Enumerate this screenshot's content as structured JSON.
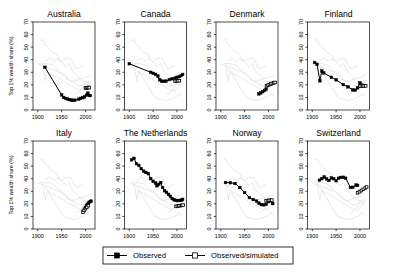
{
  "figure": {
    "width": 394,
    "height": 274,
    "background": "#ffffff",
    "foreground_color": "#000000",
    "background_series_color": "#d7d7d7"
  },
  "axes": {
    "ylabel": "Top 1% wealth share (%)",
    "ylim": [
      0,
      70
    ],
    "yticks": [
      0,
      10,
      20,
      30,
      40,
      50,
      60,
      70
    ],
    "xlim": [
      1890,
      2020
    ],
    "xticks": [
      1900,
      1950,
      2000
    ],
    "xticklabels": [
      "1900",
      "1950",
      "2000"
    ],
    "xlabel": ""
  },
  "legend": {
    "position": "bottom-center",
    "entries": [
      {
        "label": "Observed",
        "marker": "filled-square",
        "line": true
      },
      {
        "label": "Observed/simulated",
        "marker": "open-square",
        "line": true
      }
    ]
  },
  "chart_data": {
    "type": "line",
    "title": "",
    "xlabel": "",
    "ylabel": "Top 1% wealth share (%)",
    "xlim": [
      1890,
      2020
    ],
    "ylim": [
      0,
      70
    ],
    "xticks": [
      1900,
      1950,
      2000
    ],
    "yticks": [
      0,
      10,
      20,
      30,
      40,
      50,
      60,
      70
    ],
    "grid": false,
    "legend_position": "bottom-center",
    "layout": {
      "rows": 2,
      "cols": 4
    },
    "panels": [
      {
        "title": "Australia",
        "row": 0,
        "col": 0,
        "series": [
          {
            "name": "Observed",
            "marker": "filled-square",
            "x": [
              1915,
              1950,
              1954,
              1958,
              1962,
              1966,
              1970,
              1974,
              1978,
              1986,
              1990,
              1994,
              1998,
              2002,
              2005,
              2008,
              2010
            ],
            "y": [
              34.0,
              12.0,
              10.0,
              9.3,
              8.8,
              8.3,
              8.0,
              7.6,
              7.8,
              8.6,
              9.3,
              9.8,
              10.4,
              11.8,
              13.4,
              11.6,
              11.5
            ]
          },
          {
            "name": "Observed/simulated",
            "marker": "open-square",
            "x": [
              2000,
              2002,
              2004,
              2006,
              2008
            ],
            "y": [
              17.6,
              17.6,
              17.8,
              17.9,
              17.8
            ]
          }
        ]
      },
      {
        "title": "Canada",
        "row": 0,
        "col": 1,
        "series": [
          {
            "name": "Observed",
            "marker": "filled-square",
            "x": [
              1900,
              1945,
              1950,
              1955,
              1960,
              1964,
              1968,
              1972,
              1977,
              1984,
              1990,
              1996,
              2000,
              2005,
              2009,
              2012
            ],
            "y": [
              36.8,
              30.0,
              29.2,
              28.4,
              27.0,
              24.0,
              23.0,
              22.8,
              23.0,
              24.2,
              24.8,
              25.3,
              26.0,
              26.5,
              27.4,
              28.3
            ]
          },
          {
            "name": "Observed/simulated",
            "marker": "open-square",
            "x": [
              1996,
              1999,
              2002,
              2005
            ],
            "y": [
              23.0,
              23.1,
              23.2,
              23.3
            ]
          }
        ]
      },
      {
        "title": "Denmark",
        "row": 0,
        "col": 2,
        "series": [
          {
            "name": "Observed",
            "marker": "filled-square",
            "x": [
              1980,
              1984,
              1988,
              1992,
              1995
            ],
            "y": [
              12.8,
              13.6,
              14.6,
              15.6,
              16.6
            ]
          },
          {
            "name": "Observed/simulated",
            "marker": "open-square",
            "x": [
              1996,
              1999,
              2002,
              2005,
              2008,
              2011,
              2014
            ],
            "y": [
              19.2,
              19.8,
              20.3,
              20.7,
              21.2,
              21.6,
              21.9
            ]
          }
        ]
      },
      {
        "title": "Finland",
        "row": 0,
        "col": 3,
        "series": [
          {
            "name": "Observed",
            "marker": "filled-square",
            "x": [
              1905,
              1910,
              1916,
              1920,
              1924,
              1940,
              1950,
              1965,
              1975,
              1985,
              1990,
              1995,
              2000,
              2004,
              2009
            ],
            "y": [
              37.8,
              36.4,
              23.2,
              31.0,
              29.5,
              26.0,
              24.0,
              20.2,
              18.4,
              16.0,
              15.8,
              17.6,
              21.5,
              19.8,
              19.4
            ]
          },
          {
            "name": "Observed/simulated",
            "marker": "open-square",
            "x": [
              2000,
              2003,
              2006,
              2009,
              2012
            ],
            "y": [
              19.0,
              19.1,
              19.1,
              19.2,
              19.2
            ]
          }
        ]
      },
      {
        "title": "Italy",
        "row": 1,
        "col": 0,
        "series": [
          {
            "name": "Observed",
            "marker": "filled-square",
            "x": [
              1995,
              1998,
              2000,
              2002,
              2004,
              2006,
              2008,
              2010,
              2012
            ],
            "y": [
              14.0,
              15.8,
              17.2,
              18.4,
              19.2,
              20.4,
              21.2,
              21.8,
              22.2
            ]
          },
          {
            "name": "Observed/simulated",
            "marker": "open-square",
            "x": [
              1995,
              1997,
              2000,
              2003,
              2006
            ],
            "y": [
              13.4,
              14.8,
              16.2,
              17.4,
              18.6
            ]
          }
        ]
      },
      {
        "title": "The Netherlands",
        "row": 1,
        "col": 1,
        "series": [
          {
            "name": "Observed",
            "marker": "filled-square",
            "x": [
              1905,
              1910,
              1915,
              1920,
              1925,
              1930,
              1935,
              1940,
              1945,
              1950,
              1955,
              1958,
              1962,
              1966,
              1970,
              1974,
              1978,
              1982,
              1986,
              1990,
              1994,
              1998,
              2002,
              2006,
              2010,
              2012
            ],
            "y": [
              55.0,
              56.2,
              52.0,
              50.6,
              48.0,
              46.0,
              45.0,
              44.0,
              40.0,
              38.0,
              36.6,
              34.4,
              35.6,
              37.0,
              33.0,
              30.4,
              29.2,
              27.6,
              26.0,
              24.2,
              23.2,
              22.8,
              22.6,
              22.8,
              23.0,
              23.6
            ]
          },
          {
            "name": "Observed/simulated",
            "marker": "open-square",
            "x": [
              1998,
              2001,
              2004,
              2007,
              2010,
              2013
            ],
            "y": [
              18.0,
              18.2,
              18.4,
              18.6,
              18.8,
              19.0
            ]
          }
        ]
      },
      {
        "title": "Norway",
        "row": 1,
        "col": 2,
        "series": [
          {
            "name": "Observed",
            "marker": "filled-square",
            "x": [
              1910,
              1920,
              1930,
              1940,
              1950,
              1960,
              1968,
              1975,
              1980,
              1985,
              1990,
              1995,
              2000,
              2005,
              2009
            ],
            "y": [
              37.0,
              36.8,
              36.2,
              33.0,
              29.0,
              25.0,
              23.4,
              22.2,
              20.6,
              19.4,
              19.2,
              19.6,
              21.8,
              22.4,
              20.2
            ]
          },
          {
            "name": "Observed/simulated",
            "marker": "open-square",
            "x": [
              1995,
              1998,
              2001,
              2004,
              2007
            ],
            "y": [
              22.4,
              22.6,
              22.8,
              22.9,
              23.0
            ]
          }
        ]
      },
      {
        "title": "Switzerland",
        "row": 1,
        "col": 3,
        "series": [
          {
            "name": "Observed",
            "marker": "filled-square",
            "x": [
              1915,
              1920,
              1925,
              1930,
              1935,
              1940,
              1945,
              1950,
              1955,
              1960,
              1965,
              1970,
              1980,
              1985,
              1992,
              1995
            ],
            "y": [
              38.8,
              40.0,
              41.4,
              39.8,
              38.6,
              40.6,
              40.0,
              38.4,
              40.4,
              41.0,
              41.2,
              40.4,
              33.0,
              33.2,
              35.0,
              34.6
            ]
          },
          {
            "name": "Observed/simulated",
            "marker": "open-square",
            "x": [
              1995,
              1999,
              2003,
              2007,
              2011,
              2014
            ],
            "y": [
              28.8,
              29.6,
              30.6,
              31.6,
              32.6,
              33.4
            ]
          }
        ]
      }
    ],
    "background_series_note": "Faint grey lines in each panel show the series of all other countries for reference"
  }
}
